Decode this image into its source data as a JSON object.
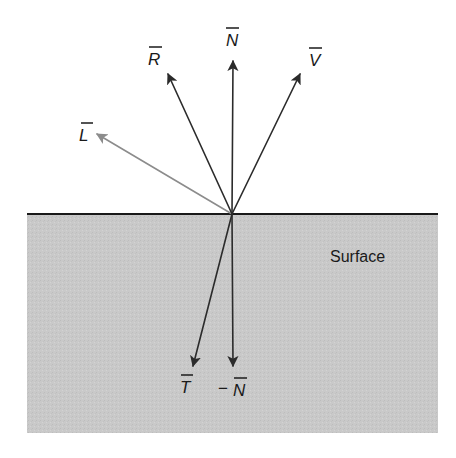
{
  "diagram": {
    "type": "vector-reflection-refraction",
    "surface": {
      "label": "Surface",
      "x": 27,
      "y": 214,
      "width": 411,
      "height": 219,
      "fill": "#c8c8c8",
      "edge_color": "#1a1a1a"
    },
    "origin": {
      "x": 232,
      "y": 214
    },
    "vectors": [
      {
        "id": "N",
        "label": "N",
        "prefix": "",
        "tip": {
          "x": 233,
          "y": 60
        },
        "color": "#2b2b2b",
        "label_pos": {
          "x": 232,
          "y": 44
        }
      },
      {
        "id": "R",
        "label": "R",
        "prefix": "",
        "tip": {
          "x": 167,
          "y": 73
        },
        "color": "#2b2b2b",
        "label_pos": {
          "x": 152,
          "y": 63
        }
      },
      {
        "id": "V",
        "label": "V",
        "prefix": "",
        "tip": {
          "x": 301,
          "y": 73
        },
        "color": "#2b2b2b",
        "label_pos": {
          "x": 315,
          "y": 64
        }
      },
      {
        "id": "L",
        "label": "L",
        "prefix": "",
        "tip": {
          "x": 96,
          "y": 133
        },
        "color": "#8c8c8c",
        "label_pos": {
          "x": 86,
          "y": 140
        }
      },
      {
        "id": "T",
        "label": "T",
        "prefix": "",
        "tip": {
          "x": 193,
          "y": 367
        },
        "color": "#2b2b2b",
        "label_pos": {
          "x": 186,
          "y": 394
        }
      },
      {
        "id": "-N",
        "label": "N",
        "prefix": "−",
        "tip": {
          "x": 233,
          "y": 367
        },
        "color": "#2b2b2b",
        "label_pos": {
          "x": 236,
          "y": 396
        }
      }
    ]
  },
  "labels": {
    "surface": "Surface",
    "N": "N",
    "R": "R",
    "V": "V",
    "L": "L",
    "T": "T",
    "negN_prefix": "−",
    "negN": "N"
  }
}
